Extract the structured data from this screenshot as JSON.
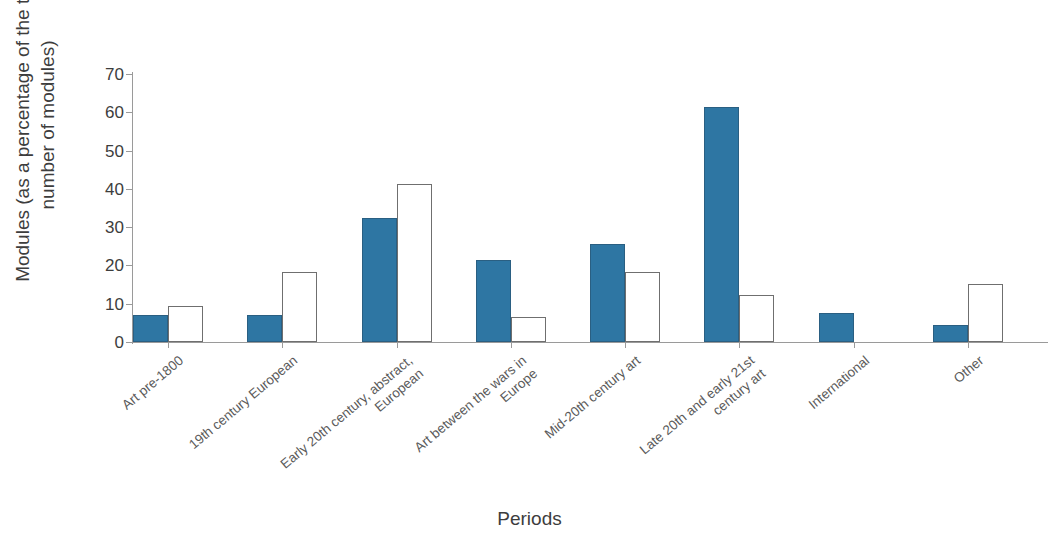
{
  "chart_data": {
    "type": "bar",
    "title": "",
    "xlabel": "Periods",
    "ylabel": "Modules (as a percentage of the total number of modules)",
    "ylim": [
      0,
      70
    ],
    "ytick_values": [
      0,
      10,
      20,
      30,
      40,
      50,
      60,
      70
    ],
    "ytick_labels": [
      "0",
      "10",
      "20",
      "30",
      "40",
      "50",
      "60",
      "70"
    ],
    "grid": false,
    "legend": "none",
    "categories": [
      "Art pre-1800",
      "19th century European",
      "Early 20th century, abstract,\nEuropean",
      "Art between the wars in\nEurope",
      "Mid-20th century art",
      "Late 20th and early 21st\ncentury art",
      "International",
      "Other"
    ],
    "series": [
      {
        "name": "Series 1",
        "color": "#2e76a3",
        "values": [
          7,
          7,
          32.5,
          21.5,
          25.5,
          61.5,
          7.5,
          4.5
        ]
      },
      {
        "name": "Series 2",
        "color": "#ffffff",
        "values": [
          9.3,
          18.3,
          41.3,
          6.5,
          18.3,
          12.3,
          0,
          15.2
        ]
      }
    ]
  },
  "axis": {
    "x_title": "Periods",
    "y_title_line1": "Modules (as a percentage of the total",
    "y_title_line2": "number of modules)"
  }
}
